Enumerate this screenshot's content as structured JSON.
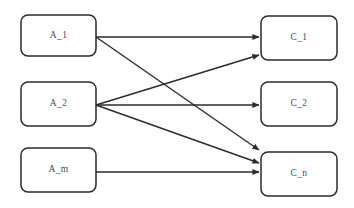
{
  "diagram": {
    "type": "bipartite-mapping",
    "background_color": "#ffffff",
    "node_fill_color": "#ffffff",
    "node_border_color": "#2b2b2b",
    "edge_color": "#2b2b2b",
    "label_color": "#4a4a4a",
    "source_nodes": [
      {
        "id": "A_1",
        "label": "A_1",
        "x": 21,
        "y": 15,
        "width": 75,
        "height": 41,
        "cx": 58.5,
        "cy": 35.5
      },
      {
        "id": "A_2",
        "label": "A_2",
        "x": 21,
        "y": 82,
        "width": 75,
        "height": 44,
        "cx": 58.5,
        "cy": 104
      },
      {
        "id": "A_m",
        "label": "A_m",
        "x": 21,
        "y": 148,
        "width": 75,
        "height": 44,
        "cx": 58.5,
        "cy": 170
      }
    ],
    "target_nodes": [
      {
        "id": "C_1",
        "label": "C_1",
        "x": 261,
        "y": 16,
        "width": 76,
        "height": 44,
        "cx": 299,
        "cy": 38
      },
      {
        "id": "C_2",
        "label": "C_2",
        "x": 261,
        "y": 82,
        "width": 76,
        "height": 44,
        "cx": 299,
        "cy": 104
      },
      {
        "id": "C_n",
        "label": "C_n",
        "x": 261,
        "y": 152,
        "width": 76,
        "height": 44,
        "cx": 299,
        "cy": 174
      }
    ],
    "edges": [
      {
        "id": "edge-a1-c1",
        "from": "A_1",
        "to": "C_1",
        "x1": 96,
        "y1": 37,
        "x2": 259,
        "y2": 37
      },
      {
        "id": "edge-a1-cn",
        "from": "A_1",
        "to": "C_n",
        "x1": 96,
        "y1": 37,
        "x2": 259,
        "y2": 150
      },
      {
        "id": "edge-a2-c1",
        "from": "A_2",
        "to": "C_1",
        "x1": 96,
        "y1": 105,
        "x2": 259,
        "y2": 55
      },
      {
        "id": "edge-a2-c2",
        "from": "A_2",
        "to": "C_2",
        "x1": 96,
        "y1": 105,
        "x2": 259,
        "y2": 105
      },
      {
        "id": "edge-a2-cn",
        "from": "A_2",
        "to": "C_n",
        "x1": 96,
        "y1": 105,
        "x2": 259,
        "y2": 163
      },
      {
        "id": "edge-am-cn",
        "from": "A_m",
        "to": "C_n",
        "x1": 96,
        "y1": 172,
        "x2": 259,
        "y2": 172
      }
    ]
  }
}
